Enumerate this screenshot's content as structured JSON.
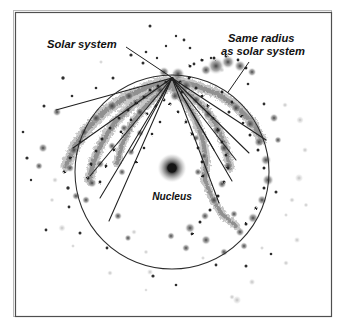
{
  "figure": {
    "title_alt": "Galaxy diagram showing spiral arms, nucleus and a circle marking the same radius as the solar system",
    "background_color": "#ffffff",
    "frame": {
      "name": "figure-frame",
      "outer_color": "#b7b7b7",
      "inner_color": "#4c4c4c",
      "x": 13,
      "y": 10,
      "width": 319,
      "height": 307
    },
    "labels": {
      "solar_system": "Solar system",
      "same_radius_line1": "Same radius",
      "same_radius_line2": "as solar system",
      "nucleus": "Nucleus"
    },
    "circle": {
      "name": "same-radius-circle",
      "cx": 172,
      "cy": 172,
      "r": 97,
      "stroke": "#2b2b2b",
      "stroke_width": 1.0
    },
    "nucleus": {
      "name": "galactic-nucleus",
      "cx": 172,
      "cy": 168,
      "r_core": 5.2,
      "r_halo": 14,
      "core_color": "#1a1a1a",
      "halo_color": "#8d8d8d"
    },
    "convergence_point": {
      "x": 172,
      "y": 78
    },
    "leaders": [
      {
        "name": "solar-system-leader",
        "x1": 126,
        "y1": 47,
        "x2": 171,
        "y2": 77
      },
      {
        "name": "same-radius-leader",
        "x1": 249,
        "y1": 62,
        "x2": 227,
        "y2": 93
      }
    ],
    "label_positions": {
      "solar_system": {
        "x": 47,
        "y": 48
      },
      "same_radius": {
        "x": 228,
        "y": 48
      },
      "nucleus": {
        "x": 172,
        "y": 199
      }
    },
    "radial_lines": [
      {
        "x2": 56,
        "y2": 110
      },
      {
        "x2": 73,
        "y2": 148
      },
      {
        "x2": 90,
        "y2": 176
      },
      {
        "x2": 100,
        "y2": 198
      },
      {
        "x2": 109,
        "y2": 221
      },
      {
        "x2": 132,
        "y2": 151
      },
      {
        "x2": 214,
        "y2": 150
      },
      {
        "x2": 236,
        "y2": 160
      },
      {
        "x2": 249,
        "y2": 153
      },
      {
        "x2": 266,
        "y2": 140
      },
      {
        "x2": 232,
        "y2": 181
      },
      {
        "x2": 219,
        "y2": 203
      }
    ],
    "spiral_arms": [
      {
        "name": "arm-upper-left",
        "points": "172,80 150,86 126,97 104,112 86,130 74,148 66,166"
      },
      {
        "name": "arm-left-mid",
        "points": "172,82 152,92 132,105 115,122 102,142 94,161 89,180"
      },
      {
        "name": "arm-inner-left",
        "points": "172,84 156,96 142,110 130,127 122,145 117,163"
      },
      {
        "name": "arm-right-upper",
        "points": "172,80 194,85 216,93 236,106 252,122 262,140"
      },
      {
        "name": "arm-right-mid",
        "points": "172,84 190,95 206,110 218,128 226,148 230,168"
      },
      {
        "name": "arm-right-inner",
        "points": "172,88 186,102 196,120 203,140 206,160 205,180"
      },
      {
        "name": "arm-lower-right",
        "points": "205,180 212,198 222,214 236,226"
      }
    ],
    "colors": {
      "ink": "#2b2b2b",
      "smudge_dark": "#6d6d6d",
      "smudge_light": "#b6b6b6",
      "star_dark": "#303030",
      "star_faint": "#a8a8a8"
    }
  }
}
